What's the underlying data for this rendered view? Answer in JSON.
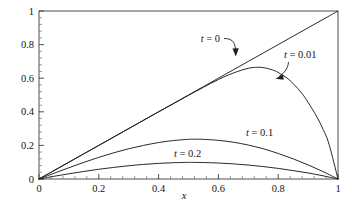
{
  "chart_data": {
    "type": "line",
    "title": "",
    "xlabel": "x",
    "ylabel": "",
    "xlim": [
      0,
      1
    ],
    "ylim": [
      0,
      1
    ],
    "grid": false,
    "legend_position": "inline-annotations",
    "xticks": [
      "0",
      "0.2",
      "0.4",
      "0.6",
      "0.8",
      "1"
    ],
    "xtick_values": [
      0,
      0.2,
      0.4,
      0.6,
      0.8,
      1
    ],
    "yticks": [
      "0",
      "0.2",
      "0.4",
      "0.6",
      "0.8",
      "1"
    ],
    "ytick_values": [
      0,
      0.2,
      0.4,
      0.6,
      0.8,
      1
    ],
    "series": [
      {
        "name": "t = 0",
        "label": "t = 0",
        "label_var": "t",
        "label_rest": " = 0",
        "x": [
          0,
          0.05,
          0.1,
          0.15,
          0.2,
          0.25,
          0.3,
          0.35,
          0.4,
          0.45,
          0.5,
          0.55,
          0.6,
          0.65,
          0.7,
          0.75,
          0.8,
          0.85,
          0.9,
          0.95,
          1
        ],
        "values": [
          0,
          0.05,
          0.1,
          0.15,
          0.2,
          0.25,
          0.3,
          0.35,
          0.4,
          0.45,
          0.5,
          0.55,
          0.6,
          0.65,
          0.7,
          0.75,
          0.8,
          0.85,
          0.9,
          0.95,
          1
        ],
        "peak_x": 1,
        "peak_y": 1
      },
      {
        "name": "t = 0.01",
        "label": "t = 0.01",
        "label_var": "t",
        "label_rest": " = 0.01",
        "x": [
          0,
          0.05,
          0.1,
          0.15,
          0.2,
          0.25,
          0.3,
          0.35,
          0.4,
          0.45,
          0.5,
          0.55,
          0.6,
          0.65,
          0.7,
          0.73,
          0.75,
          0.78,
          0.8,
          0.83,
          0.85,
          0.88,
          0.9,
          0.93,
          0.95,
          0.97,
          1
        ],
        "values": [
          0,
          0.05,
          0.1,
          0.15,
          0.2,
          0.25,
          0.3,
          0.35,
          0.4,
          0.449,
          0.498,
          0.546,
          0.592,
          0.631,
          0.659,
          0.665,
          0.663,
          0.65,
          0.634,
          0.6,
          0.568,
          0.508,
          0.456,
          0.368,
          0.296,
          0.207,
          0
        ],
        "peak_x": 0.73,
        "peak_y": 0.665
      },
      {
        "name": "t = 0.1",
        "label": "t = 0.1",
        "label_var": "t",
        "label_rest": " = 0.1",
        "x": [
          0,
          0.05,
          0.1,
          0.15,
          0.2,
          0.25,
          0.3,
          0.35,
          0.4,
          0.45,
          0.5,
          0.52,
          0.55,
          0.6,
          0.65,
          0.7,
          0.75,
          0.8,
          0.85,
          0.9,
          0.95,
          1
        ],
        "values": [
          0,
          0.034,
          0.067,
          0.099,
          0.129,
          0.156,
          0.18,
          0.2,
          0.217,
          0.229,
          0.236,
          0.237,
          0.236,
          0.23,
          0.219,
          0.202,
          0.18,
          0.152,
          0.12,
          0.084,
          0.044,
          0
        ],
        "peak_x": 0.52,
        "peak_y": 0.237
      },
      {
        "name": "t = 0.2",
        "label": "t = 0.2",
        "label_var": "t",
        "label_rest": " = 0.2",
        "x": [
          0,
          0.05,
          0.1,
          0.15,
          0.2,
          0.25,
          0.3,
          0.35,
          0.4,
          0.45,
          0.5,
          0.51,
          0.55,
          0.6,
          0.65,
          0.7,
          0.75,
          0.8,
          0.85,
          0.9,
          0.95,
          1
        ],
        "values": [
          0,
          0.016,
          0.031,
          0.045,
          0.058,
          0.069,
          0.079,
          0.087,
          0.093,
          0.097,
          0.099,
          0.099,
          0.098,
          0.095,
          0.09,
          0.083,
          0.074,
          0.063,
          0.05,
          0.036,
          0.019,
          0
        ],
        "peak_x": 0.51,
        "peak_y": 0.099
      }
    ],
    "annotations": [
      {
        "name": "t-0-annotation",
        "text": "t = 0",
        "var": "t",
        "rest": " = 0",
        "points_to": "straight-line",
        "arrow": "curved-down-right"
      },
      {
        "name": "t-001-annotation",
        "text": "t = 0.01",
        "var": "t",
        "rest": " = 0.01",
        "points_to": "t001-curve",
        "arrow": "curved-down-left"
      },
      {
        "name": "t-01-annotation",
        "text": "t = 0.1",
        "var": "t",
        "rest": " = 0.1",
        "points_to": "t01-curve",
        "arrow": "none"
      },
      {
        "name": "t-02-annotation",
        "text": "t = 0.2",
        "var": "t",
        "rest": " = 0.2",
        "points_to": "t02-curve",
        "arrow": "none"
      }
    ]
  }
}
